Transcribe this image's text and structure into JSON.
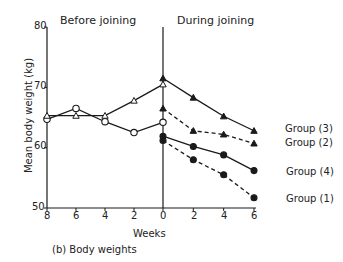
{
  "chart_data": {
    "type": "line",
    "title": "",
    "caption": "(b) Body weights",
    "xlabel": "Weeks",
    "ylabel": "Mean body weight (kg)",
    "ylim": [
      50,
      80
    ],
    "yticks": [
      50,
      60,
      70,
      80
    ],
    "grid": false,
    "panels": [
      {
        "name": "Before joining",
        "xticks": [
          8,
          6,
          4,
          2,
          0
        ]
      },
      {
        "name": "During joining",
        "xticks": [
          0,
          2,
          4,
          6
        ]
      }
    ],
    "series": [
      {
        "name": "Before: open circles",
        "panel": "Before joining",
        "marker": "open-circle",
        "line": "solid",
        "x": [
          8,
          6,
          4,
          2,
          0
        ],
        "values": [
          64.7,
          66.5,
          64.3,
          62.5,
          64.2
        ]
      },
      {
        "name": "Before: open triangles",
        "panel": "Before joining",
        "marker": "open-triangle",
        "line": "solid",
        "x": [
          8,
          6,
          4,
          2,
          0
        ],
        "values": [
          65.3,
          65.3,
          65.3,
          67.8,
          70.5
        ]
      },
      {
        "name": "Group (3)",
        "panel": "During joining",
        "marker": "filled-triangle",
        "line": "solid",
        "x": [
          0,
          2,
          4,
          6
        ],
        "values": [
          71.5,
          68.3,
          65.2,
          62.8
        ]
      },
      {
        "name": "Group (2)",
        "panel": "During joining",
        "marker": "filled-triangle",
        "line": "dashed",
        "x": [
          0,
          2,
          4,
          6
        ],
        "values": [
          66.5,
          62.8,
          62.2,
          60.7
        ]
      },
      {
        "name": "Group (4)",
        "panel": "During joining",
        "marker": "filled-circle",
        "line": "solid",
        "x": [
          0,
          2,
          4,
          6
        ],
        "values": [
          61.9,
          60.2,
          58.8,
          56.2
        ]
      },
      {
        "name": "Group (1)",
        "panel": "During joining",
        "marker": "filled-circle",
        "line": "dashed",
        "x": [
          0,
          2,
          4,
          6
        ],
        "values": [
          61.2,
          58.0,
          55.5,
          51.7
        ]
      }
    ],
    "legend_position": "right, inline labels"
  },
  "labels": {
    "before": "Before joining",
    "during": "During joining",
    "ylabel": "Mean body weight (kg)",
    "xlabel": "Weeks",
    "caption": "(b) Body weights",
    "group3": "Group (3)",
    "group2": "Group (2)",
    "group4": "Group (4)",
    "group1": "Group (1)"
  },
  "ticks": {
    "y80": "80",
    "y70": "70",
    "y60": "60",
    "y50": "50",
    "x8": "8",
    "x6b": "6",
    "x4b": "4",
    "x2b": "2",
    "x0": "0",
    "x2d": "2",
    "x4d": "4",
    "x6d": "6"
  }
}
